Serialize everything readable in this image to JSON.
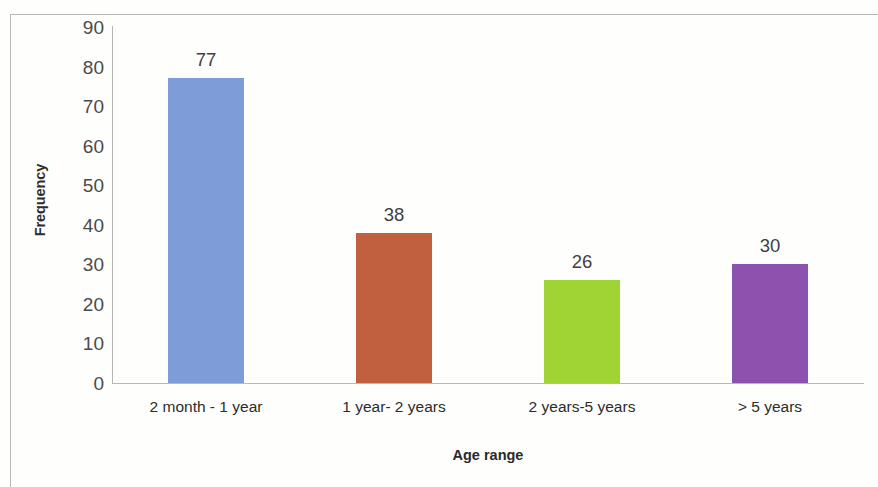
{
  "chart_data": {
    "type": "bar",
    "title": "",
    "subtitle": "",
    "xlabel": "Age range",
    "ylabel": "Frequency",
    "categories": [
      "2 month - 1 year",
      "1 year- 2 years",
      "2 years-5 years",
      "> 5 years"
    ],
    "values": [
      77,
      38,
      26,
      30
    ],
    "value_labels": [
      "77",
      "38",
      "26",
      "30"
    ],
    "colors": [
      "#7d9cd8",
      "#c0603f",
      "#9fd435",
      "#8d52ad"
    ],
    "ylim": [
      0,
      90
    ],
    "y_ticks": [
      "90",
      "80",
      "70",
      "60",
      "50",
      "40",
      "30",
      "20",
      "10",
      "0"
    ],
    "y_tick_values": [
      90,
      80,
      70,
      60,
      50,
      40,
      30,
      20,
      10,
      0
    ],
    "grid": false,
    "legend": false,
    "legend_position": "none",
    "series": [
      {
        "name": "Frequency",
        "values": [
          77,
          38,
          26,
          30
        ]
      }
    ]
  },
  "axes": {
    "y_title": "Frequency",
    "x_title": "Age range"
  },
  "bars": [
    {
      "label": "2 month - 1 year",
      "value_label": "77",
      "color": "#7d9cd8"
    },
    {
      "label": "1 year- 2 years",
      "value_label": "38",
      "color": "#c0603f"
    },
    {
      "label": "2 years-5 years",
      "value_label": "26",
      "color": "#9fd435"
    },
    {
      "label": "> 5 years",
      "value_label": "30",
      "color": "#8d52ad"
    }
  ]
}
